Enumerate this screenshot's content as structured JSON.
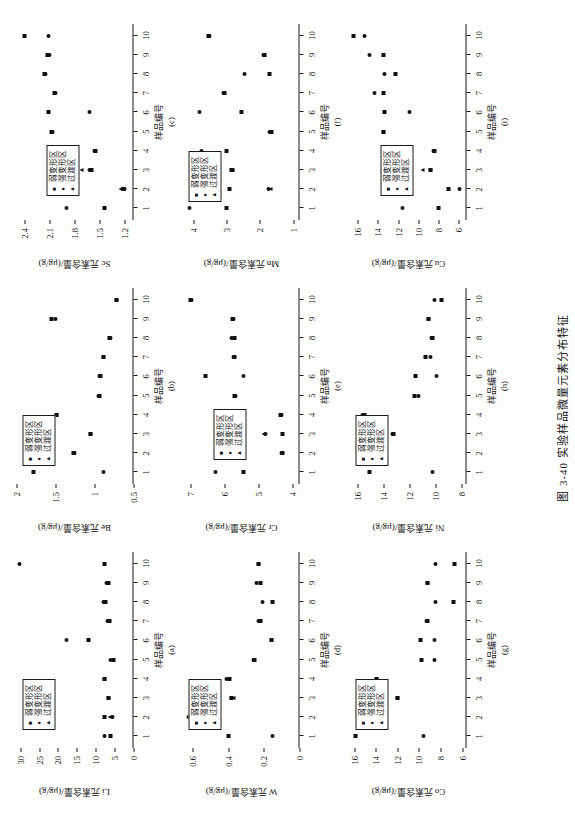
{
  "figure": {
    "caption": "图 3-40  实验样品微量元素分布特征",
    "xtitle": "样品编号",
    "legend": [
      {
        "marker": "square",
        "label": "弱变形区"
      },
      {
        "marker": "circle",
        "label": "强变形区"
      },
      {
        "marker": "triangle",
        "label": "过渡区"
      }
    ]
  },
  "chart_data": [
    {
      "type": "scatter",
      "panel": "(a)",
      "title": "",
      "xlabel": "样品编号",
      "ylabel": "Li 元素含量/(μg/g)",
      "xticks": [
        1,
        2,
        3,
        4,
        5,
        6,
        7,
        8,
        9,
        10
      ],
      "yticks": [
        0,
        5,
        10,
        15,
        20,
        25,
        30
      ],
      "xlim": [
        0.4,
        10.6
      ],
      "ylim": [
        0,
        31
      ],
      "grid": false,
      "legend_pos": "top-left",
      "series": [
        {
          "name": "弱变形区",
          "marker": "square",
          "x": [
            1,
            2,
            3,
            4,
            5,
            6,
            7,
            8,
            9,
            10
          ],
          "values": [
            6.0,
            7.5,
            6.5,
            7.5,
            5.3,
            12.0,
            6.3,
            7.3,
            6.5,
            7.5
          ]
        },
        {
          "name": "强变形区",
          "marker": "circle",
          "x": [
            1,
            2,
            3,
            4,
            5,
            6,
            7,
            8,
            9,
            10
          ],
          "values": [
            7.5,
            5.4,
            6.6,
            7.6,
            5.9,
            17.8,
            6.9,
            7.8,
            7.0,
            30.2
          ]
        },
        {
          "name": "过渡区",
          "marker": "triangle",
          "x": [
            2
          ],
          "values": [
            6.4
          ]
        }
      ]
    },
    {
      "type": "scatter",
      "panel": "(b)",
      "title": "",
      "xlabel": "样品编号",
      "ylabel": "Be 元素含量/(μg/g)",
      "xticks": [
        1,
        2,
        3,
        4,
        5,
        6,
        7,
        8,
        9,
        10
      ],
      "yticks": [
        0.5,
        1.0,
        1.5,
        2.0
      ],
      "xlim": [
        0.4,
        10.6
      ],
      "ylim": [
        0.5,
        2.0
      ],
      "grid": false,
      "legend_pos": "top-left",
      "series": [
        {
          "name": "弱变形区",
          "marker": "square",
          "x": [
            1,
            2,
            3,
            4,
            5,
            6,
            7,
            8,
            9,
            10
          ],
          "values": [
            1.78,
            1.27,
            1.05,
            1.48,
            0.93,
            0.92,
            0.88,
            0.8,
            1.55,
            0.72
          ]
        },
        {
          "name": "强变形区",
          "marker": "circle",
          "x": [
            1,
            2,
            3,
            4,
            5,
            6,
            7,
            8,
            9,
            10
          ],
          "values": [
            0.88,
            1.26,
            1.05,
            1.48,
            0.94,
            0.93,
            0.88,
            0.79,
            1.5,
            0.72
          ]
        },
        {
          "name": "过渡区",
          "marker": "triangle",
          "x": [
            2
          ],
          "values": [
            1.27
          ]
        }
      ]
    },
    {
      "type": "scatter",
      "panel": "(c)",
      "title": "",
      "xlabel": "样品编号",
      "ylabel": "Sc 元素含量/(μg/g)",
      "xticks": [
        1,
        2,
        3,
        4,
        5,
        6,
        7,
        8,
        9,
        10
      ],
      "yticks": [
        1.2,
        1.5,
        1.8,
        2.1,
        2.4
      ],
      "xlim": [
        0.4,
        10.6
      ],
      "ylim": [
        1.1,
        2.5
      ],
      "grid": false,
      "legend_pos": "left",
      "series": [
        {
          "name": "弱变形区",
          "marker": "square",
          "x": [
            1,
            2,
            3,
            4,
            5,
            6,
            7,
            8,
            9,
            10
          ],
          "values": [
            1.45,
            1.22,
            1.6,
            1.55,
            2.08,
            2.12,
            2.05,
            2.16,
            2.13,
            2.4
          ]
        },
        {
          "name": "强变形区",
          "marker": "circle",
          "x": [
            1,
            2,
            3,
            4,
            5,
            6,
            7,
            8,
            9,
            10
          ],
          "values": [
            1.9,
            1.21,
            1.62,
            1.57,
            2.07,
            1.62,
            2.03,
            2.15,
            2.1,
            2.12
          ]
        },
        {
          "name": "过渡区",
          "marker": "triangle",
          "x": [
            2,
            3
          ],
          "values": [
            1.25,
            1.72
          ]
        }
      ]
    },
    {
      "type": "scatter",
      "panel": "(d)",
      "title": "",
      "xlabel": "样品编号",
      "ylabel": "W 元素含量/(μg/g)",
      "xticks": [
        1,
        2,
        3,
        4,
        5,
        6,
        7,
        8,
        9,
        10
      ],
      "yticks": [
        0.0,
        0.2,
        0.4,
        0.6
      ],
      "xlim": [
        0.4,
        10.6
      ],
      "ylim": [
        0.0,
        0.65
      ],
      "grid": false,
      "legend_pos": "top-left",
      "series": [
        {
          "name": "弱变形区",
          "marker": "square",
          "x": [
            1,
            2,
            3,
            4,
            5,
            6,
            7,
            8,
            9,
            10
          ],
          "values": [
            0.4,
            0.58,
            0.38,
            0.39,
            0.25,
            0.16,
            0.22,
            0.15,
            0.22,
            0.23
          ]
        },
        {
          "name": "强变形区",
          "marker": "circle",
          "x": [
            1,
            2,
            3,
            4,
            5,
            6,
            7,
            8,
            9,
            10
          ],
          "values": [
            0.15,
            0.62,
            0.38,
            0.41,
            0.26,
            0.16,
            0.23,
            0.21,
            0.24,
            0.23
          ]
        },
        {
          "name": "过渡区",
          "marker": "triangle",
          "x": [
            3
          ],
          "values": [
            0.37
          ]
        }
      ]
    },
    {
      "type": "scatter",
      "panel": "(e)",
      "title": "",
      "xlabel": "样品编号",
      "ylabel": "Cr 元素含量/(μg/g)",
      "xticks": [
        1,
        2,
        3,
        4,
        5,
        6,
        7,
        8,
        9,
        10
      ],
      "yticks": [
        4,
        5,
        6,
        7
      ],
      "xlim": [
        0.4,
        10.6
      ],
      "ylim": [
        3.8,
        7.2
      ],
      "grid": false,
      "legend_pos": "left",
      "series": [
        {
          "name": "弱变形区",
          "marker": "square",
          "x": [
            1,
            2,
            3,
            4,
            5,
            6,
            7,
            8,
            9,
            10
          ],
          "values": [
            5.45,
            4.3,
            4.3,
            4.35,
            5.7,
            6.55,
            5.7,
            5.7,
            5.75,
            7.0
          ]
        },
        {
          "name": "强变形区",
          "marker": "circle",
          "x": [
            1,
            2,
            3,
            4,
            5,
            6,
            7,
            8,
            9,
            10
          ],
          "values": [
            6.25,
            4.32,
            4.8,
            4.33,
            5.68,
            5.45,
            5.72,
            5.8,
            5.72,
            6.95
          ]
        },
        {
          "name": "过渡区",
          "marker": "triangle",
          "x": [
            3
          ],
          "values": [
            4.85
          ]
        }
      ]
    },
    {
      "type": "scatter",
      "panel": "(f)",
      "title": "",
      "xlabel": "样品编号",
      "ylabel": "Mn 元素含量/(μg/g)",
      "xticks": [
        1,
        2,
        3,
        4,
        5,
        6,
        7,
        8,
        9,
        10
      ],
      "yticks": [
        1,
        2,
        3,
        4
      ],
      "xlim": [
        0.4,
        10.6
      ],
      "ylim": [
        0.8,
        4.3
      ],
      "grid": false,
      "legend_pos": "top-left",
      "series": [
        {
          "name": "弱变形区",
          "marker": "square",
          "x": [
            1,
            2,
            3,
            4,
            5,
            6,
            7,
            8,
            9,
            10
          ],
          "values": [
            3.0,
            2.9,
            2.85,
            3.0,
            1.65,
            2.55,
            3.05,
            1.7,
            1.85,
            3.55
          ]
        },
        {
          "name": "强变形区",
          "marker": "circle",
          "x": [
            1,
            2,
            3,
            4,
            5,
            6,
            7,
            8,
            9,
            10
          ],
          "values": [
            4.1,
            1.75,
            2.83,
            3.75,
            1.72,
            3.8,
            3.1,
            2.45,
            1.88,
            3.5
          ]
        },
        {
          "name": "过渡区",
          "marker": "triangle",
          "x": [
            2,
            3
          ],
          "values": [
            1.68,
            2.82
          ]
        }
      ]
    },
    {
      "type": "scatter",
      "panel": "(g)",
      "title": "",
      "xlabel": "样品编号",
      "ylabel": "Co 元素含量/(μg/g)",
      "xticks": [
        1,
        2,
        3,
        4,
        5,
        6,
        7,
        8,
        9,
        10
      ],
      "yticks": [
        6,
        8,
        10,
        12,
        14,
        16
      ],
      "xlim": [
        0.4,
        10.6
      ],
      "ylim": [
        5.6,
        16.4
      ],
      "grid": false,
      "legend_pos": "top-left",
      "series": [
        {
          "name": "弱变形区",
          "marker": "square",
          "x": [
            1,
            2,
            3,
            4,
            5,
            6,
            7,
            8,
            9,
            10
          ],
          "values": [
            15.9,
            13.3,
            12.0,
            13.9,
            9.8,
            9.9,
            9.2,
            6.8,
            9.2,
            6.7
          ]
        },
        {
          "name": "强变形区",
          "marker": "circle",
          "x": [
            1,
            2,
            3,
            4,
            5,
            6,
            7,
            8,
            9,
            10
          ],
          "values": [
            9.6,
            13.2,
            12.0,
            13.9,
            8.6,
            8.6,
            9.3,
            8.5,
            9.2,
            8.5
          ]
        },
        {
          "name": "过渡区",
          "marker": "triangle",
          "x": [
            2
          ],
          "values": [
            13.5
          ]
        }
      ]
    },
    {
      "type": "scatter",
      "panel": "(h)",
      "title": "",
      "xlabel": "样品编号",
      "ylabel": "Ni 元素含量/(μg/g)",
      "xticks": [
        1,
        2,
        3,
        4,
        5,
        6,
        7,
        8,
        9,
        10
      ],
      "yticks": [
        8,
        10,
        12,
        14,
        16
      ],
      "xlim": [
        0.4,
        10.6
      ],
      "ylim": [
        7.6,
        16.6
      ],
      "grid": false,
      "legend_pos": "top-left",
      "series": [
        {
          "name": "弱变形区",
          "marker": "square",
          "x": [
            1,
            2,
            3,
            4,
            5,
            6,
            7,
            8,
            9,
            10
          ],
          "values": [
            15.1,
            15.1,
            13.2,
            15.5,
            11.6,
            11.5,
            10.8,
            10.2,
            10.5,
            9.5
          ]
        },
        {
          "name": "强变形区",
          "marker": "circle",
          "x": [
            1,
            2,
            3,
            4,
            5,
            6,
            7,
            8,
            9,
            10
          ],
          "values": [
            10.2,
            16.0,
            13.3,
            15.6,
            11.3,
            9.9,
            10.4,
            10.3,
            10.5,
            10.1
          ]
        },
        {
          "name": "过渡区",
          "marker": "triangle",
          "x": [
            2
          ],
          "values": [
            16.0
          ]
        }
      ]
    },
    {
      "type": "scatter",
      "panel": "(i)",
      "title": "",
      "xlabel": "样品编号",
      "ylabel": "Cu 元素含量/(μg/g)",
      "xticks": [
        1,
        2,
        3,
        4,
        5,
        6,
        7,
        8,
        9,
        10
      ],
      "yticks": [
        6,
        8,
        10,
        12,
        14,
        16
      ],
      "xlim": [
        0.4,
        10.6
      ],
      "ylim": [
        5.2,
        16.8
      ],
      "grid": false,
      "legend_pos": "left",
      "series": [
        {
          "name": "弱变形区",
          "marker": "square",
          "x": [
            1,
            2,
            3,
            4,
            5,
            6,
            7,
            8,
            9,
            10
          ],
          "values": [
            8.0,
            7.0,
            8.8,
            8.4,
            13.5,
            13.4,
            13.5,
            12.3,
            13.5,
            16.4
          ]
        },
        {
          "name": "强变形区",
          "marker": "circle",
          "x": [
            1,
            2,
            3,
            4,
            5,
            6,
            7,
            8,
            9,
            10
          ],
          "values": [
            11.6,
            5.9,
            8.8,
            8.5,
            13.5,
            10.9,
            14.3,
            13.4,
            14.8,
            15.3
          ]
        },
        {
          "name": "过渡区",
          "marker": "triangle",
          "x": [
            3
          ],
          "values": [
            9.6
          ]
        }
      ]
    }
  ]
}
